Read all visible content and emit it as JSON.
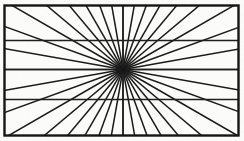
{
  "figure": {
    "kind": "optical-illusion-diagram",
    "background_color": "#fcfcfa",
    "line_color": "#161616",
    "frame_color": "#111111"
  },
  "chart_data": {
    "type": "scatter",
    "subtitle": "",
    "xlabel": "",
    "ylabel": "",
    "xlim": [
      0,
      244
    ],
    "ylim": [
      0,
      141
    ],
    "grid": false,
    "legend": null,
    "tick_labels_x": [],
    "tick_labels_y": [],
    "annotations": [],
    "frame": {
      "x": 4.5,
      "y": 5.5,
      "width": 234,
      "height": 130,
      "stroke_width": 2.4,
      "stroke": "#111111",
      "fill": "#fdfdfb"
    },
    "center": {
      "x": 123,
      "y": 69.5
    },
    "hub_radius": 2.1,
    "ray_count": 36,
    "ray_stroke_width": 1.5,
    "ray_angles_deg": [
      0,
      10,
      20,
      30,
      40,
      50,
      60,
      70,
      80,
      90,
      100,
      110,
      120,
      130,
      140,
      150,
      160,
      170,
      180,
      190,
      200,
      210,
      220,
      230,
      240,
      250,
      260,
      270,
      280,
      290,
      300,
      310,
      320,
      330,
      340,
      350
    ],
    "horizontal_chords": [
      {
        "name": "upper-chord",
        "y": 40.5,
        "stroke_width": 1.6
      },
      {
        "name": "middle-chord",
        "y": 69.5,
        "stroke_width": 1.6
      },
      {
        "name": "lower-chord",
        "y": 99.5,
        "stroke_width": 1.6
      }
    ],
    "vertical_line": {
      "name": "center-vertical",
      "x": 123,
      "stroke_width": 1.5
    },
    "series": [
      {
        "name": "rays",
        "values": [
          0,
          10,
          20,
          30,
          40,
          50,
          60,
          70,
          80,
          90,
          100,
          110,
          120,
          130,
          140,
          150,
          160,
          170,
          180,
          190,
          200,
          210,
          220,
          230,
          240,
          250,
          260,
          270,
          280,
          290,
          300,
          310,
          320,
          330,
          340,
          350
        ]
      },
      {
        "name": "horizontal-chord-y-positions",
        "values": [
          40.5,
          69.5,
          99.5
        ]
      }
    ]
  }
}
